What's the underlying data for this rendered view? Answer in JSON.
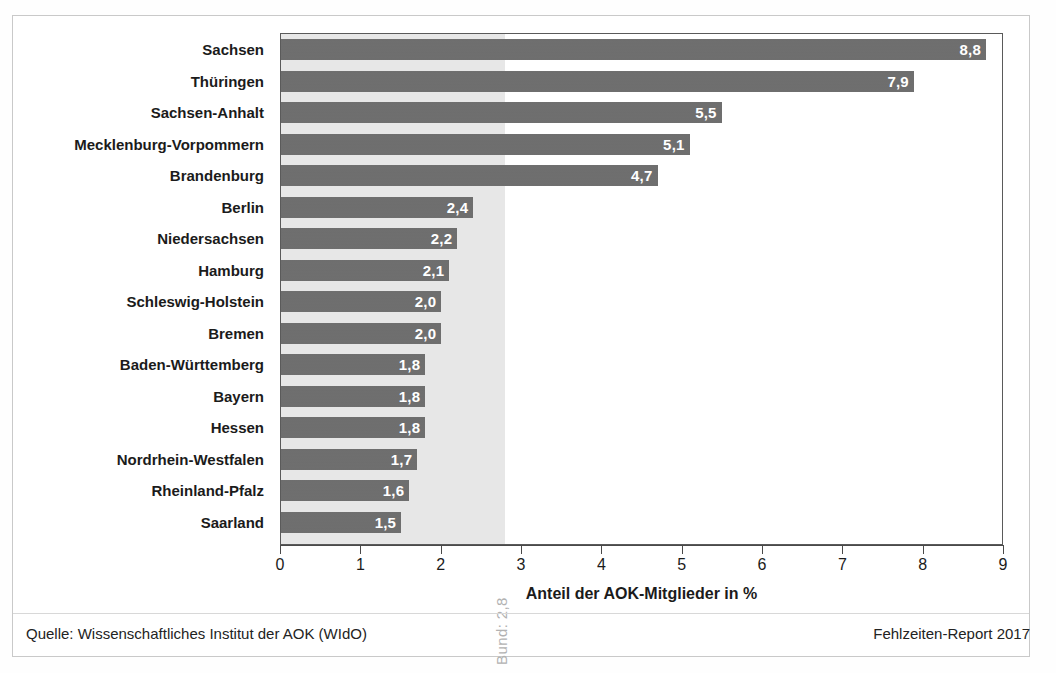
{
  "chart_data": {
    "type": "bar",
    "orientation": "horizontal",
    "title": "",
    "xlabel": "Anteil der AOK-Mitglieder in %",
    "ylabel": "",
    "xlim": [
      0,
      9
    ],
    "xticks": [
      "0",
      "1",
      "2",
      "3",
      "4",
      "5",
      "6",
      "7",
      "8",
      "9"
    ],
    "grid": false,
    "legend": null,
    "categories": [
      "Sachsen",
      "Thüringen",
      "Sachsen-Anhalt",
      "Mecklenburg-Vorpommern",
      "Brandenburg",
      "Berlin",
      "Niedersachsen",
      "Hamburg",
      "Schleswig-Holstein",
      "Bremen",
      "Baden-Württemberg",
      "Bayern",
      "Hessen",
      "Nordrhein-Westfalen",
      "Rheinland-Pfalz",
      "Saarland"
    ],
    "values": [
      8.8,
      7.9,
      5.5,
      5.1,
      4.7,
      2.4,
      2.2,
      2.1,
      2.0,
      2.0,
      1.8,
      1.8,
      1.8,
      1.7,
      1.6,
      1.5
    ],
    "value_labels": [
      "8,8",
      "7,9",
      "5,5",
      "5,1",
      "4,7",
      "2,4",
      "2,2",
      "2,1",
      "2,0",
      "2,0",
      "1,8",
      "1,8",
      "1,8",
      "1,7",
      "1,6",
      "1,5"
    ],
    "annotations": [
      {
        "name": "bund-reference",
        "label": "Bund: 2,8",
        "value": 2.8,
        "style": "shaded-band-0-to-2.8",
        "orientation": "vertical"
      }
    ],
    "colors": {
      "bar": "#6d6d6d",
      "band": "#e7e7e7",
      "value_label": "#ffffff",
      "axis": "#4a4a4a",
      "text": "#1b1b1b",
      "annotation": "#b2b2b2"
    }
  },
  "footer": {
    "source": "Quelle: Wissenschaftliches Institut der AOK (WIdO)",
    "report": "Fehlzeiten-Report 2017"
  }
}
